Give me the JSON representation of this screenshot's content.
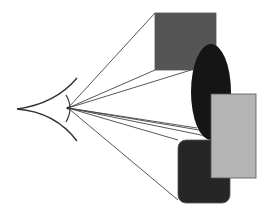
{
  "diagram": {
    "title": "",
    "colors": {
      "background": "#ffffff",
      "line": "#444444",
      "eye_stroke": "#333333",
      "gray_square": "#555555",
      "black_ellipse": "#151515",
      "light_rect": "#b4b4b4",
      "dark_rounded_rect": "#262626",
      "shape_outline": "#555555"
    },
    "eye": {
      "tip": [
        17,
        109
      ],
      "focal_point": [
        68,
        108
      ],
      "upper_arc_end": [
        77,
        78
      ],
      "lower_arc_end": [
        77,
        141
      ]
    },
    "shapes": [
      {
        "name": "gray-square",
        "type": "rect",
        "x": 155,
        "y": 13,
        "width": 61,
        "height": 57
      },
      {
        "name": "black-ellipse",
        "type": "ellipse",
        "cx": 211,
        "cy": 92,
        "rx": 20,
        "ry": 48
      },
      {
        "name": "light-rectangle",
        "type": "rect",
        "x": 211,
        "y": 94,
        "width": 45,
        "height": 84
      },
      {
        "name": "dark-rounded-rectangle",
        "type": "rect",
        "x": 178,
        "y": 140,
        "width": 52,
        "height": 63,
        "rx": 8
      }
    ],
    "sight_lines": [
      [
        155,
        13
      ],
      [
        155,
        70
      ],
      [
        191,
        70
      ],
      [
        197,
        128
      ],
      [
        211,
        132
      ],
      [
        211,
        137
      ],
      [
        178,
        140
      ],
      [
        178,
        200
      ]
    ]
  }
}
